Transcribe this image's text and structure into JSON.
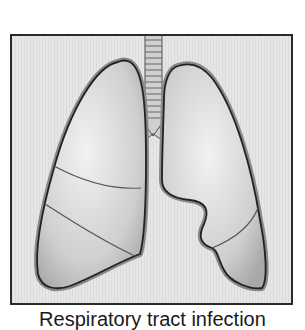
{
  "figure": {
    "caption": "Respiratory tract infection",
    "colors": {
      "background": "#e6e6e6",
      "frame_border": "#2a2a2a",
      "lung_fill": "#d2d2d2",
      "pleura_outline": "#222222"
    },
    "parts": [
      "trachea",
      "right-lung",
      "left-lung",
      "upper-lobe",
      "middle-lobe",
      "lower-lobe"
    ]
  }
}
